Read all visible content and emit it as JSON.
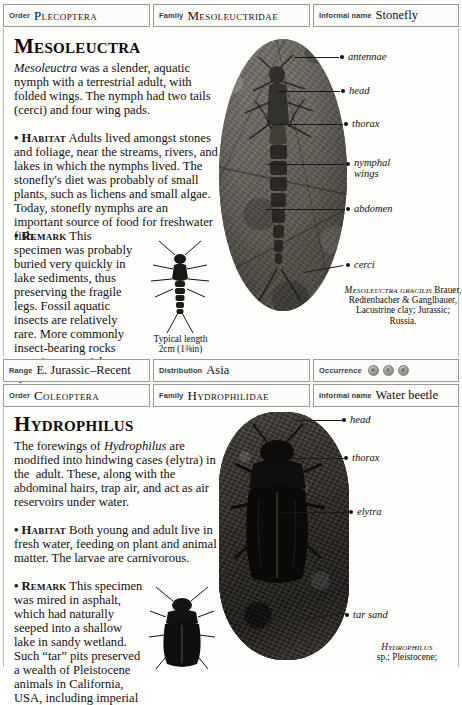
{
  "entries": [
    {
      "header": {
        "order_label": "Order",
        "order_value": "Plecoptera",
        "family_label": "Family",
        "family_value": "Mesoleuctridae",
        "informal_label": "Informal name",
        "informal_value": "Stonefly"
      },
      "title": "Mesoleuctra",
      "paragraphs": [
        "Mesoleuctra was a slender, aquatic nymph with a terrestrial adult, with folded wings. The nymph had two tails (cerci) and four wing pads.",
        "• HABITAT Adults lived amongst stones and foliage, near the streams, rivers, and lakes in which the nymphs lived. The stonefly's diet was probably of small plants, such as lichens and small algae. Today, stonefly nymphs are an important source of food for freshwater fish.",
        "• REMARK This specimen was probably buried very quickly in lake sediments, thus preserving the fragile legs. Fossil aquatic insects are relatively rare. More commonly insect-bearing rocks contain terrestrial species, blown into lake sediments."
      ],
      "callouts": [
        "antennae",
        "head",
        "thorax",
        "nymphal wings",
        "abdomen",
        "cerci"
      ],
      "scale_caption": "Typical length\n2cm (1¾in)",
      "specimen_caption_genus": "Mesoleuctra",
      "specimen_caption_species": "gracilis",
      "specimen_caption_rest": "Brauer, Redtenbacher & Ganglbauer, Lacustrine clay; Jurassic; Russia.",
      "footer": {
        "range_label": "Range",
        "range_value": "E. Jurassic–Recent",
        "distribution_label": "Distribution",
        "distribution_value": "Asia",
        "occurrence_label": "Occurrence",
        "occurrence_count": 3
      }
    },
    {
      "header": {
        "order_label": "Order",
        "order_value": "Coleoptera",
        "family_label": "Family",
        "family_value": "Hydrophilidae",
        "informal_label": "Informal name",
        "informal_value": "Water beetle"
      },
      "title": "Hydrophilus",
      "paragraphs": [
        "The forewings of Hydrophilus are modified into hindwing cases (elytra) in the  adult. These, along with the abdominal hairs, trap air, and act as air reservoirs under water.",
        "• HABITAT Both young and adult live in fresh water, feeding on plant and animal matter. The larvae are carnivorous.",
        "• REMARK This specimen was mired in asphalt, which had naturally seeped into a shallow lake in sandy wetland. Such “tar” pits preserved a wealth of Pleistocene animals in California, USA, including imperial"
      ],
      "callouts": [
        "head",
        "thorax",
        "elytra",
        "tar sand"
      ],
      "specimen_caption_genus": "Hydrophilus",
      "specimen_caption_rest": "sp.; Pleistocene;"
    }
  ]
}
